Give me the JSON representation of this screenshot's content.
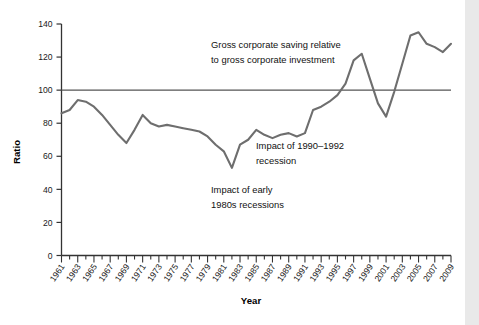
{
  "chart_data": {
    "type": "line",
    "title": "",
    "xlabel": "Year",
    "ylabel": "Ratio",
    "ylim": [
      0,
      140
    ],
    "yticks": [
      0,
      20,
      40,
      60,
      80,
      100,
      120,
      140
    ],
    "xlim": [
      1961,
      2009
    ],
    "grid": false,
    "legend": "none",
    "reference_line": {
      "value": 100,
      "label": ""
    },
    "series_name": "Gross corporate saving relative to gross corporate investment",
    "line_color": "#6e6e6e",
    "x": [
      1961,
      1962,
      1963,
      1964,
      1965,
      1966,
      1967,
      1968,
      1969,
      1970,
      1971,
      1972,
      1973,
      1974,
      1975,
      1976,
      1977,
      1978,
      1979,
      1980,
      1981,
      1982,
      1983,
      1984,
      1985,
      1986,
      1987,
      1988,
      1989,
      1990,
      1991,
      1992,
      1993,
      1994,
      1995,
      1996,
      1997,
      1998,
      1999,
      2000,
      2001,
      2002,
      2003,
      2004,
      2005,
      2006,
      2007,
      2008,
      2009
    ],
    "values": [
      86,
      88,
      94,
      93,
      90,
      85,
      79,
      73,
      68,
      76,
      85,
      80,
      78,
      79,
      78,
      77,
      76,
      75,
      72,
      67,
      63,
      53,
      67,
      70,
      76,
      73,
      71,
      73,
      74,
      72,
      74,
      88,
      90,
      93,
      97,
      104,
      118,
      122,
      107,
      92,
      84,
      99,
      116,
      133,
      135,
      128,
      126,
      123,
      128
    ],
    "x_tick_labels": [
      "1961",
      "1963",
      "1965",
      "1967",
      "1969",
      "1971",
      "1973",
      "1975",
      "1977",
      "1979",
      "1981",
      "1983",
      "1985",
      "1987",
      "1989",
      "1991",
      "1993",
      "1995",
      "1997",
      "1999",
      "2001",
      "2003",
      "2005",
      "2007",
      "2009"
    ],
    "annotations": [
      {
        "id": "series-label",
        "text_lines": [
          "Gross corporate saving relative",
          "to gross corporate investment"
        ],
        "x": 1988,
        "y": 132
      },
      {
        "id": "recession-1990-1992",
        "text_lines": [
          "Impact of 1990–1992",
          "recession"
        ],
        "x": 1990,
        "y": 72
      },
      {
        "id": "recession-early-1980s",
        "text_lines": [
          "Impact of early",
          "1980s recessions"
        ],
        "x": 1979,
        "y": 42
      }
    ]
  },
  "axes": {
    "ylabel": "Ratio",
    "xlabel": "Year"
  },
  "annotation_text": {
    "series_line1": "Gross corporate saving relative",
    "series_line2": "to gross corporate investment",
    "recession90_line1": "Impact of 1990–1992",
    "recession90_line2": "recession",
    "recession80_line1": "Impact of early",
    "recession80_line2": "1980s recessions"
  },
  "colors": {
    "line": "#6e6e6e",
    "axis": "#333333",
    "reference_line": "#555555",
    "text": "#111111",
    "right_strip": "#e9e9e9"
  }
}
